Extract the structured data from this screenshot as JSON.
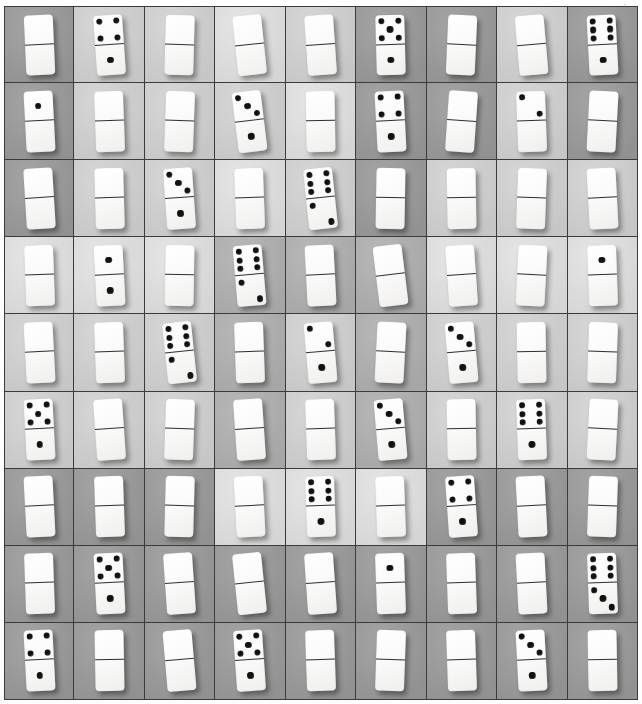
{
  "image": {
    "kind": "photograph-grid",
    "title": "Grid of domino tiles",
    "rows": 9,
    "columns": 9,
    "width": 642,
    "height": 704,
    "corner_mark": "·"
  },
  "palette": {
    "tile_face": "#fafafa",
    "pip": "#111111",
    "divider_line": "#2f2f2f",
    "grid_line": "#3b3b3b",
    "backdrop_dark": "#9a9a9a",
    "backdrop_mid": "#b0b0b0",
    "backdrop_light": "#d2d2d2",
    "backdrop_pale": "#e2e2e2"
  },
  "pip_layouts": {
    "0": [],
    "1": [
      "p-mc"
    ],
    "2": [
      "p-tl",
      "p-br"
    ],
    "3": [
      "p-tl",
      "p-mc",
      "p-br"
    ],
    "4": [
      "p-tl",
      "p-tr",
      "p-bl",
      "p-br"
    ],
    "5": [
      "p-tl",
      "p-tr",
      "p-mc",
      "p-bl",
      "p-br"
    ],
    "6": [
      "p-tl",
      "p-tr",
      "p-ml",
      "p-mr",
      "p-bl",
      "p-br"
    ]
  },
  "cells": [
    {
      "row": 1,
      "col": 1,
      "top": 0,
      "bottom": 0,
      "tilt": -2.5,
      "bg": "bg-dark"
    },
    {
      "row": 1,
      "col": 2,
      "top": 4,
      "bottom": 1,
      "tilt": -4.0,
      "bg": "bg-light"
    },
    {
      "row": 1,
      "col": 3,
      "top": 0,
      "bottom": 0,
      "tilt": 1.5,
      "bg": "bg-light"
    },
    {
      "row": 1,
      "col": 4,
      "top": 0,
      "bottom": 0,
      "tilt": -6.0,
      "bg": "bg-pale"
    },
    {
      "row": 1,
      "col": 5,
      "top": 0,
      "bottom": 0,
      "tilt": -4.0,
      "bg": "bg-light"
    },
    {
      "row": 1,
      "col": 6,
      "top": 5,
      "bottom": 1,
      "tilt": -1.5,
      "bg": "bg-dark"
    },
    {
      "row": 1,
      "col": 7,
      "top": 0,
      "bottom": 0,
      "tilt": 2.5,
      "bg": "bg-dark"
    },
    {
      "row": 1,
      "col": 8,
      "top": 0,
      "bottom": 0,
      "tilt": -5.0,
      "bg": "bg-light"
    },
    {
      "row": 1,
      "col": 9,
      "top": 6,
      "bottom": 1,
      "tilt": -3.0,
      "bg": "bg-dark"
    },
    {
      "row": 2,
      "col": 1,
      "top": 1,
      "bottom": 0,
      "tilt": -3.0,
      "bg": "bg-dark"
    },
    {
      "row": 2,
      "col": 2,
      "top": 0,
      "bottom": 0,
      "tilt": -2.0,
      "bg": "bg-light"
    },
    {
      "row": 2,
      "col": 3,
      "top": 0,
      "bottom": 0,
      "tilt": 2.0,
      "bg": "bg-light"
    },
    {
      "row": 2,
      "col": 4,
      "top": 3,
      "bottom": 1,
      "tilt": -7.0,
      "bg": "bg-light"
    },
    {
      "row": 2,
      "col": 5,
      "top": 0,
      "bottom": 0,
      "tilt": -1.0,
      "bg": "bg-pale"
    },
    {
      "row": 2,
      "col": 6,
      "top": 4,
      "bottom": 1,
      "tilt": -3.0,
      "bg": "bg-dark"
    },
    {
      "row": 2,
      "col": 7,
      "top": 0,
      "bottom": 0,
      "tilt": 4.0,
      "bg": "bg-dark"
    },
    {
      "row": 2,
      "col": 8,
      "top": 2,
      "bottom": 0,
      "tilt": -2.0,
      "bg": "bg-light"
    },
    {
      "row": 2,
      "col": 9,
      "top": 0,
      "bottom": 0,
      "tilt": 3.0,
      "bg": "bg-dark"
    },
    {
      "row": 3,
      "col": 1,
      "top": 0,
      "bottom": 0,
      "tilt": -3.5,
      "bg": "bg-dark"
    },
    {
      "row": 3,
      "col": 2,
      "top": 0,
      "bottom": 0,
      "tilt": -1.5,
      "bg": "bg-light"
    },
    {
      "row": 3,
      "col": 3,
      "top": 3,
      "bottom": 1,
      "tilt": -4.0,
      "bg": "bg-light"
    },
    {
      "row": 3,
      "col": 4,
      "top": 0,
      "bottom": 0,
      "tilt": -2.0,
      "bg": "bg-pale"
    },
    {
      "row": 3,
      "col": 5,
      "top": 6,
      "bottom": 2,
      "tilt": -6.0,
      "bg": "bg-light"
    },
    {
      "row": 3,
      "col": 6,
      "top": 0,
      "bottom": 0,
      "tilt": 1.0,
      "bg": "bg-dark"
    },
    {
      "row": 3,
      "col": 7,
      "top": 0,
      "bottom": 0,
      "tilt": -1.0,
      "bg": "bg-light"
    },
    {
      "row": 3,
      "col": 8,
      "top": 0,
      "bottom": 0,
      "tilt": 2.0,
      "bg": "bg-light"
    },
    {
      "row": 3,
      "col": 9,
      "top": 0,
      "bottom": 0,
      "tilt": -3.0,
      "bg": "bg-light"
    },
    {
      "row": 4,
      "col": 1,
      "top": 0,
      "bottom": 0,
      "tilt": -2.0,
      "bg": "bg-pale"
    },
    {
      "row": 4,
      "col": 2,
      "top": 1,
      "bottom": 1,
      "tilt": -3.0,
      "bg": "bg-pale"
    },
    {
      "row": 4,
      "col": 3,
      "top": 0,
      "bottom": 0,
      "tilt": 1.0,
      "bg": "bg-pale"
    },
    {
      "row": 4,
      "col": 4,
      "top": 6,
      "bottom": 2,
      "tilt": -5.0,
      "bg": "bg-mid"
    },
    {
      "row": 4,
      "col": 5,
      "top": 0,
      "bottom": 0,
      "tilt": -3.0,
      "bg": "bg-mid"
    },
    {
      "row": 4,
      "col": 6,
      "top": 0,
      "bottom": 0,
      "tilt": -7.0,
      "bg": "bg-mid"
    },
    {
      "row": 4,
      "col": 7,
      "top": 0,
      "bottom": 0,
      "tilt": -4.0,
      "bg": "bg-pale"
    },
    {
      "row": 4,
      "col": 8,
      "top": 0,
      "bottom": 0,
      "tilt": 3.0,
      "bg": "bg-pale"
    },
    {
      "row": 4,
      "col": 9,
      "top": 1,
      "bottom": 0,
      "tilt": -2.0,
      "bg": "bg-pale"
    },
    {
      "row": 5,
      "col": 1,
      "top": 0,
      "bottom": 0,
      "tilt": -3.0,
      "bg": "bg-light"
    },
    {
      "row": 5,
      "col": 2,
      "top": 0,
      "bottom": 0,
      "tilt": -2.0,
      "bg": "bg-light"
    },
    {
      "row": 5,
      "col": 3,
      "top": 6,
      "bottom": 2,
      "tilt": -6.0,
      "bg": "bg-light"
    },
    {
      "row": 5,
      "col": 4,
      "top": 0,
      "bottom": 0,
      "tilt": -2.0,
      "bg": "bg-mid"
    },
    {
      "row": 5,
      "col": 5,
      "top": 2,
      "bottom": 1,
      "tilt": -5.0,
      "bg": "bg-light"
    },
    {
      "row": 5,
      "col": 6,
      "top": 0,
      "bottom": 0,
      "tilt": 3.0,
      "bg": "bg-mid"
    },
    {
      "row": 5,
      "col": 7,
      "top": 3,
      "bottom": 1,
      "tilt": -5.0,
      "bg": "bg-light"
    },
    {
      "row": 5,
      "col": 8,
      "top": 0,
      "bottom": 0,
      "tilt": -1.0,
      "bg": "bg-light"
    },
    {
      "row": 5,
      "col": 9,
      "top": 0,
      "bottom": 0,
      "tilt": 2.0,
      "bg": "bg-light"
    },
    {
      "row": 6,
      "col": 1,
      "top": 5,
      "bottom": 1,
      "tilt": -3.0,
      "bg": "bg-light"
    },
    {
      "row": 6,
      "col": 2,
      "top": 0,
      "bottom": 0,
      "tilt": -4.0,
      "bg": "bg-light"
    },
    {
      "row": 6,
      "col": 3,
      "top": 0,
      "bottom": 0,
      "tilt": 2.0,
      "bg": "bg-light"
    },
    {
      "row": 6,
      "col": 4,
      "top": 0,
      "bottom": 0,
      "tilt": -4.0,
      "bg": "bg-mid"
    },
    {
      "row": 6,
      "col": 5,
      "top": 0,
      "bottom": 0,
      "tilt": -2.0,
      "bg": "bg-light"
    },
    {
      "row": 6,
      "col": 6,
      "top": 3,
      "bottom": 1,
      "tilt": -5.0,
      "bg": "bg-mid"
    },
    {
      "row": 6,
      "col": 7,
      "top": 0,
      "bottom": 0,
      "tilt": -1.0,
      "bg": "bg-light"
    },
    {
      "row": 6,
      "col": 8,
      "top": 6,
      "bottom": 1,
      "tilt": -2.0,
      "bg": "bg-light"
    },
    {
      "row": 6,
      "col": 9,
      "top": 0,
      "bottom": 0,
      "tilt": 3.0,
      "bg": "bg-light"
    },
    {
      "row": 7,
      "col": 1,
      "top": 0,
      "bottom": 0,
      "tilt": -3.0,
      "bg": "bg-dark"
    },
    {
      "row": 7,
      "col": 2,
      "top": 0,
      "bottom": 0,
      "tilt": -2.0,
      "bg": "bg-dark"
    },
    {
      "row": 7,
      "col": 3,
      "top": 0,
      "bottom": 0,
      "tilt": 1.5,
      "bg": "bg-dark"
    },
    {
      "row": 7,
      "col": 4,
      "top": 0,
      "bottom": 0,
      "tilt": -3.0,
      "bg": "bg-pale"
    },
    {
      "row": 7,
      "col": 5,
      "top": 6,
      "bottom": 1,
      "tilt": -2.0,
      "bg": "bg-pale"
    },
    {
      "row": 7,
      "col": 6,
      "top": 0,
      "bottom": 0,
      "tilt": -2.0,
      "bg": "bg-pale"
    },
    {
      "row": 7,
      "col": 7,
      "top": 4,
      "bottom": 1,
      "tilt": -4.0,
      "bg": "bg-dark"
    },
    {
      "row": 7,
      "col": 8,
      "top": 0,
      "bottom": 0,
      "tilt": -3.0,
      "bg": "bg-dark"
    },
    {
      "row": 7,
      "col": 9,
      "top": 0,
      "bottom": 0,
      "tilt": 2.0,
      "bg": "bg-dark"
    },
    {
      "row": 8,
      "col": 1,
      "top": 0,
      "bottom": 0,
      "tilt": -2.0,
      "bg": "bg-dark"
    },
    {
      "row": 8,
      "col": 2,
      "top": 5,
      "bottom": 1,
      "tilt": -3.0,
      "bg": "bg-dark"
    },
    {
      "row": 8,
      "col": 3,
      "top": 0,
      "bottom": 0,
      "tilt": -4.0,
      "bg": "bg-dark"
    },
    {
      "row": 8,
      "col": 4,
      "top": 0,
      "bottom": 0,
      "tilt": -6.0,
      "bg": "bg-dark"
    },
    {
      "row": 8,
      "col": 5,
      "top": 0,
      "bottom": 0,
      "tilt": -4.0,
      "bg": "bg-dark"
    },
    {
      "row": 8,
      "col": 6,
      "top": 1,
      "bottom": 0,
      "tilt": -2.0,
      "bg": "bg-dark"
    },
    {
      "row": 8,
      "col": 7,
      "top": 0,
      "bottom": 0,
      "tilt": -2.0,
      "bg": "bg-dark"
    },
    {
      "row": 8,
      "col": 8,
      "top": 0,
      "bottom": 0,
      "tilt": -3.0,
      "bg": "bg-dark"
    },
    {
      "row": 8,
      "col": 9,
      "top": 6,
      "bottom": 3,
      "tilt": -2.0,
      "bg": "bg-dark"
    },
    {
      "row": 9,
      "col": 1,
      "top": 4,
      "bottom": 1,
      "tilt": -3.0,
      "bg": "bg-dark"
    },
    {
      "row": 9,
      "col": 2,
      "top": 0,
      "bottom": 0,
      "tilt": -1.0,
      "bg": "bg-dark"
    },
    {
      "row": 9,
      "col": 3,
      "top": 0,
      "bottom": 0,
      "tilt": -5.0,
      "bg": "bg-dark"
    },
    {
      "row": 9,
      "col": 4,
      "top": 5,
      "bottom": 1,
      "tilt": -4.0,
      "bg": "bg-dark"
    },
    {
      "row": 9,
      "col": 5,
      "top": 0,
      "bottom": 0,
      "tilt": -2.0,
      "bg": "bg-dark"
    },
    {
      "row": 9,
      "col": 6,
      "top": 0,
      "bottom": 0,
      "tilt": 2.0,
      "bg": "bg-dark"
    },
    {
      "row": 9,
      "col": 7,
      "top": 0,
      "bottom": 0,
      "tilt": -2.0,
      "bg": "bg-dark"
    },
    {
      "row": 9,
      "col": 8,
      "top": 3,
      "bottom": 1,
      "tilt": -3.0,
      "bg": "bg-dark"
    },
    {
      "row": 9,
      "col": 9,
      "top": 0,
      "bottom": 0,
      "tilt": -1.0,
      "bg": "bg-dark"
    }
  ]
}
